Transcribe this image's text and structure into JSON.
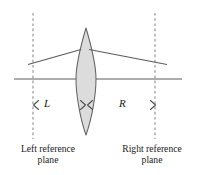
{
  "figure": {
    "background_color": "#ffffff",
    "stroke_color": "#5a5a5a",
    "dash_color": "#8c8c8c",
    "lens_fill": "#dcdcdc",
    "text_color": "#1a1a1a"
  },
  "labels": {
    "distance_left": "L",
    "distance_right": "R",
    "left_plane_line1": "Left reference",
    "left_plane_line2": "plane",
    "right_plane_line1": "Right reference",
    "right_plane_line2": "plane"
  },
  "geometry": {
    "optical_axis": {
      "x1": 14,
      "y1": 79,
      "x2": 182,
      "y2": 79
    },
    "left_reference_plane": {
      "x": 33,
      "y_top": 13,
      "y_bottom": 139
    },
    "right_reference_plane": {
      "x": 155,
      "y_top": 13,
      "y_bottom": 139
    },
    "lens": {
      "apex_top_y": 28,
      "apex_bottom_y": 135,
      "center_x": 86,
      "half_width": 10,
      "left_edge_x": 76,
      "right_edge_x": 96
    },
    "ray_incoming": {
      "x1": 28,
      "y1": 64,
      "x2": 80,
      "y2": 50
    },
    "ray_outgoing": {
      "x1": 88,
      "y1": 50,
      "x2": 167,
      "y2": 64
    },
    "dimension_line_y": 105,
    "dimension_L": {
      "x_start": 33,
      "x_end": 86
    },
    "dimension_R": {
      "x_start": 86,
      "x_end": 155
    }
  }
}
